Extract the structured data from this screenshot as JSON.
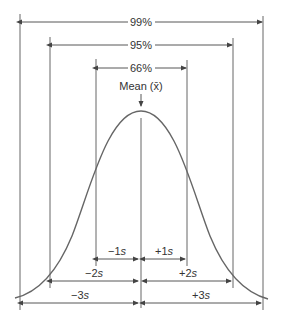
{
  "diagram": {
    "type": "normal-distribution",
    "colors": {
      "line": "#555555",
      "curve": "#666666",
      "text": "#333333",
      "background": "#ffffff"
    },
    "intervals": [
      {
        "label": "99%",
        "span": "±3s"
      },
      {
        "label": "95%",
        "span": "±2s"
      },
      {
        "label": "66%",
        "span": "±1s"
      }
    ],
    "mean_label": "Mean (x̄)",
    "mean_text": "Mean (",
    "mean_symbol": "x̄",
    "mean_close": ")",
    "sd_labels": {
      "minus1": {
        "sign": "−1",
        "unit": "s"
      },
      "plus1": {
        "sign": "+1",
        "unit": "s"
      },
      "minus2": {
        "sign": "−2",
        "unit": "s"
      },
      "plus2": {
        "sign": "+2",
        "unit": "s"
      },
      "minus3": {
        "sign": "−3",
        "unit": "s"
      },
      "plus3": {
        "sign": "+3",
        "unit": "s"
      }
    }
  }
}
